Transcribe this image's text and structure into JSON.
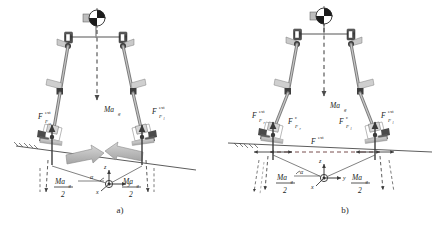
{
  "figure": {
    "type": "mechanics-free-body-diagram",
    "panels": [
      {
        "id": "a",
        "caption": "a)",
        "description": "Biped with external contact forces at both feet and inward compressive ground arrows",
        "labels": {
          "com_force": "Ma",
          "com_force_sub": "g",
          "left_force": "F",
          "left_force_sup": "ext",
          "left_force_sub": "F",
          "left_force_subsub": "r",
          "right_force": "F",
          "right_force_sup": "ext",
          "right_force_sub": "F",
          "right_force_subsub": "l",
          "reaction_left_num": "Ma",
          "reaction_left_num_sub": "g",
          "reaction_left_den": "2",
          "reaction_right_num": "Ma",
          "reaction_right_num_sub": "g",
          "reaction_right_den": "2",
          "angle": "α",
          "axis_z": "z",
          "axis_y": "y",
          "axis_x": "x"
        }
      },
      {
        "id": "b",
        "caption": "b)",
        "description": "Biped with both external and internal contact forces at the feet plus a horizontal external force line",
        "labels": {
          "com_force": "Ma",
          "com_force_sub": "g",
          "left_force_ext": "F",
          "left_force_ext_sup": "ext",
          "left_force_ext_sub": "F",
          "left_force_ext_subsub": "r",
          "left_force_int": "F",
          "left_force_int_sup": "c",
          "left_force_int_sub": "F",
          "left_force_int_subsub": "r",
          "right_force_int": "F",
          "right_force_int_sup": "c",
          "right_force_int_sub": "F",
          "right_force_int_subsub": "l",
          "right_force_ext": "F",
          "right_force_ext_sup": "ext",
          "right_force_ext_sub": "F",
          "right_force_ext_subsub": "l",
          "horizontal_force": "F",
          "horizontal_force_sup": "ext",
          "reaction_left_num": "Ma",
          "reaction_left_num_sub": "g",
          "reaction_left_den": "2",
          "reaction_right_num": "Ma",
          "reaction_right_num_sub": "g",
          "reaction_right_den": "2",
          "angle": "α",
          "axis_z": "z",
          "axis_y": "y",
          "axis_x": "x"
        }
      }
    ],
    "colors": {
      "line": "#4a4a4a",
      "dark_joint": "#3a3a3a",
      "limb_gray": "#9a9a9a",
      "arrow_gray": "#b8b8b8",
      "arrow_stroke": "#8c8c8c",
      "ground": "#5a5a5a",
      "foot_plate": "#c0c0c0",
      "text": "#222222",
      "dashed": "#555555"
    }
  }
}
